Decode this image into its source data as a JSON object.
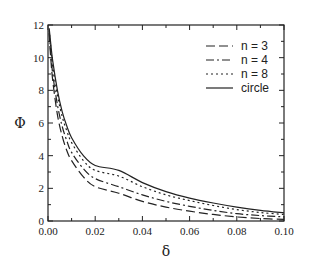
{
  "chart_data": {
    "type": "line",
    "title": "",
    "xlabel": "δ",
    "ylabel": "Φ",
    "xlim": [
      0.0,
      0.1
    ],
    "ylim": [
      0,
      12
    ],
    "x_ticks": [
      "0.00",
      "0.02",
      "0.04",
      "0.06",
      "0.08",
      "0.10"
    ],
    "y_ticks": [
      "0",
      "2",
      "4",
      "6",
      "8",
      "10",
      "12"
    ],
    "grid": false,
    "legend_position": "upper right",
    "x": [
      0.0005,
      0.001,
      0.002,
      0.004,
      0.006,
      0.008,
      0.01,
      0.015,
      0.02,
      0.03,
      0.04,
      0.05,
      0.06,
      0.07,
      0.08,
      0.09,
      0.1
    ],
    "series": [
      {
        "name": "n = 3",
        "style": "long-dash",
        "values": [
          11.5,
          10.3,
          8.6,
          6.5,
          5.2,
          4.3,
          3.7,
          2.7,
          2.1,
          1.7,
          1.2,
          0.85,
          0.6,
          0.4,
          0.25,
          0.15,
          0.1
        ]
      },
      {
        "name": "n = 4",
        "style": "dash-dot",
        "values": [
          11.6,
          10.6,
          9.0,
          7.1,
          5.8,
          4.9,
          4.2,
          3.2,
          2.6,
          2.1,
          1.6,
          1.2,
          0.9,
          0.65,
          0.45,
          0.33,
          0.25
        ]
      },
      {
        "name": "n = 8",
        "style": "dotted",
        "values": [
          11.7,
          10.9,
          9.5,
          7.7,
          6.4,
          5.5,
          4.8,
          3.7,
          3.1,
          2.75,
          2.1,
          1.6,
          1.25,
          0.95,
          0.7,
          0.52,
          0.4
        ]
      },
      {
        "name": "circle",
        "style": "solid",
        "values": [
          11.8,
          11.1,
          9.8,
          8.0,
          6.7,
          5.8,
          5.1,
          4.0,
          3.4,
          3.1,
          2.35,
          1.8,
          1.4,
          1.1,
          0.85,
          0.65,
          0.5
        ]
      }
    ]
  }
}
